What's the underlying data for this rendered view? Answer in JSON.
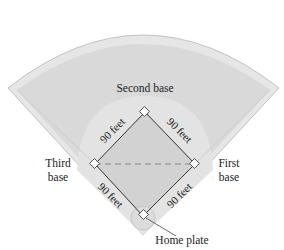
{
  "diagram": {
    "type": "baseball-diamond",
    "colors": {
      "background": "#ffffff",
      "outfield_border": "#e4e4e4",
      "outfield": "#d8d8d8",
      "infield_grass": "#e2e2e2",
      "infield": "#d4d4d4",
      "line": "#333333",
      "edge": "#b0b0b0"
    },
    "labels": {
      "second_base": "Second base",
      "third_base_line1": "Third",
      "third_base_line2": "base",
      "first_base_line1": "First",
      "first_base_line2": "base",
      "home_plate": "Home plate"
    },
    "dimensions": {
      "home_to_first": "90 feet",
      "first_to_second": "90 feet",
      "second_to_third": "90 feet",
      "third_to_home": "90 feet"
    },
    "dashed_line": "third-base to first-base"
  }
}
